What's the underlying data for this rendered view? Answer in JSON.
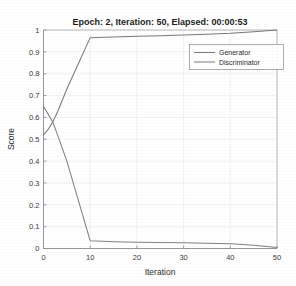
{
  "chart_data": {
    "type": "line",
    "title": "Epoch: 2, Iteration: 50, Elapsed: 00:00:53",
    "xlabel": "Iteration",
    "ylabel": "Score",
    "xlim": [
      0,
      50
    ],
    "ylim": [
      0,
      1
    ],
    "grid": true,
    "legend_position": "top-right",
    "xticks": [
      "0",
      "10",
      "20",
      "30",
      "40",
      "50"
    ],
    "xtick_values": [
      0,
      10,
      20,
      30,
      40,
      50
    ],
    "yticks": [
      "0",
      "0.1",
      "0.2",
      "0.3",
      "0.4",
      "0.5",
      "0.6",
      "0.7",
      "0.8",
      "0.9",
      "1"
    ],
    "ytick_values": [
      0,
      0.1,
      0.2,
      0.3,
      0.4,
      0.5,
      0.6,
      0.7,
      0.8,
      0.9,
      1
    ],
    "x": [
      0,
      1,
      2,
      3,
      5,
      10,
      15,
      20,
      25,
      30,
      35,
      40,
      45,
      50
    ],
    "series": [
      {
        "name": "Generator",
        "color": "#7a7a7a",
        "values": [
          0.52,
          0.545,
          0.58,
          0.625,
          0.73,
          0.965,
          0.968,
          0.971,
          0.974,
          0.977,
          0.981,
          0.985,
          0.992,
          1.0
        ]
      },
      {
        "name": "Discriminator",
        "color": "#828282",
        "values": [
          0.65,
          0.615,
          0.578,
          0.52,
          0.4,
          0.035,
          0.031,
          0.029,
          0.027,
          0.026,
          0.024,
          0.022,
          0.015,
          0.005
        ]
      }
    ]
  },
  "legend": {
    "entries": [
      {
        "label": "Generator"
      },
      {
        "label": "Discriminator"
      }
    ]
  },
  "figure": {
    "background_color": "#ffffff",
    "axis_color": "#8c8c8c",
    "grid_color": "#e8e8e8",
    "text_color": "#2b2b2b"
  }
}
